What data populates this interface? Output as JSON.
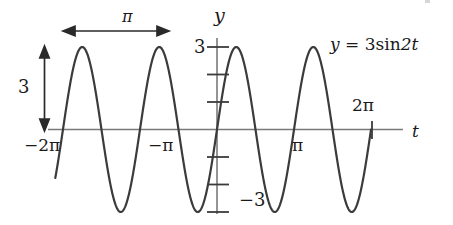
{
  "figure": {
    "kind": "math-graph",
    "background_color": "#ffffff",
    "curve_color": "#3b3b3b",
    "axis_color": "#6e6e6e",
    "text_color": "#1a1a1a"
  },
  "labels": {
    "y_axis": "y",
    "t_axis": "t",
    "equation": "y = 3 sin 2t",
    "equation_parts": {
      "lhs": "y",
      "equals": "=",
      "coefficient": "3",
      "function": "sin",
      "argument": "2t"
    },
    "period_annotation": "π",
    "amplitude_annotation": "3",
    "y_tick_pos": "3",
    "y_tick_neg": "−3",
    "x_tick_minus_2pi": "−2π",
    "x_tick_minus_pi": "−π",
    "x_tick_pi": "π",
    "x_tick_2pi": "2π"
  },
  "chart_data": {
    "type": "line",
    "title": "",
    "subtitle": "",
    "xlabel": "t",
    "ylabel": "y",
    "grid": false,
    "legend": null,
    "equation": "y = 3 sin 2t",
    "amplitude": 3,
    "angular_frequency": 2,
    "period": 3.14159265,
    "xlim": [
      -6.5973,
      7.0686
    ],
    "ylim": [
      -3.6,
      3.6
    ],
    "x_ticks": [
      -6.2832,
      -3.1416,
      3.1416,
      6.2832
    ],
    "x_tick_labels": [
      "−2π",
      "−π",
      "π",
      "2π"
    ],
    "y_ticks": [
      -3,
      -2,
      -1,
      1,
      2,
      3
    ],
    "y_tick_labels": [
      "−3",
      "",
      "",
      "",
      "",
      "3"
    ],
    "series": [
      {
        "name": "y = 3 sin 2t",
        "x": [
          -6.2832,
          -6.0,
          -5.7,
          -5.4963,
          -5.2,
          -4.9,
          -4.7124,
          -4.4,
          -4.1,
          -3.927,
          -3.6,
          -3.3,
          -3.1416,
          -2.9,
          -2.6,
          -2.3562,
          -2.1,
          -1.8,
          -1.5708,
          -1.3,
          -1.0,
          -0.7854,
          -0.5,
          -0.2,
          0.0,
          0.3,
          0.6,
          0.7854,
          1.0,
          1.3,
          1.5708,
          1.8,
          2.1,
          2.3562,
          2.6,
          2.9,
          3.1416,
          3.4,
          3.7,
          3.927,
          4.2,
          4.5,
          4.7124,
          5.0,
          5.3,
          5.4978,
          5.8,
          6.1,
          6.2832
        ],
        "y": [
          0.0,
          1.3,
          2.53,
          3.0,
          2.72,
          1.34,
          0.0,
          -1.73,
          -2.88,
          -3.0,
          -2.17,
          -0.52,
          0.0,
          1.22,
          2.51,
          3.0,
          2.75,
          1.4,
          0.0,
          -1.67,
          -2.73,
          -3.0,
          -2.52,
          -1.17,
          0.0,
          1.65,
          2.76,
          3.0,
          2.73,
          1.4,
          0.0,
          -1.67,
          -2.73,
          -3.0,
          -2.51,
          -1.22,
          0.0,
          1.49,
          2.71,
          3.0,
          2.6,
          0.78,
          0.0,
          -1.68,
          -2.9,
          -3.0,
          -2.33,
          -0.69,
          0.0
        ]
      }
    ],
    "annotations": [
      {
        "name": "period-arrow",
        "text": "π",
        "type": "double-arrow-horizontal",
        "from_x": -5.4963,
        "to_x": -3.927,
        "at_y": 3.35
      },
      {
        "name": "amplitude-arrow",
        "text": "3",
        "type": "double-arrow-vertical",
        "at_x": -6.85,
        "from_y": 0,
        "to_y": 3
      },
      {
        "name": "equation-label",
        "text": "y = 3 sin 2t",
        "type": "text",
        "at_x": 4.1,
        "at_y": 3.1
      }
    ]
  }
}
